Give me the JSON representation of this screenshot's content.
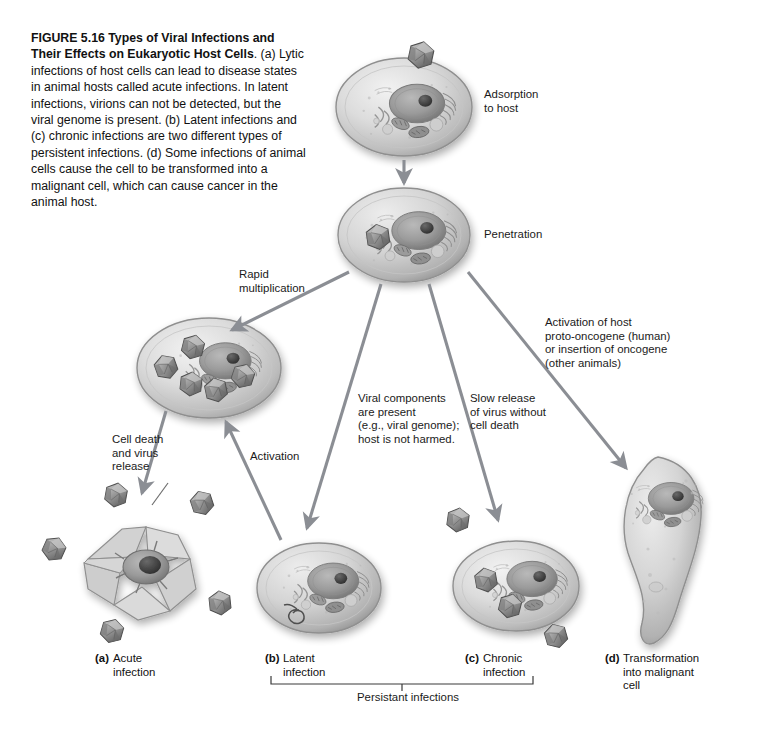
{
  "figure": {
    "number": "FIGURE 5.16",
    "title": "Types of Viral Infections and Their Effects on Eukaryotic Host Cells",
    "body": ". (a) Lytic infections of host cells can lead to disease states in animal hosts called acute infections. In latent infections, virions can not be detected, but the viral genome is present. (b) Latent infections and (c) chronic infections are two different types of persistent infections. (d) Some infections of animal cells cause the cell to be transformed into a malignant cell, which can cause cancer in the animal host."
  },
  "labels": {
    "adsorption": "Adsorption\nto host",
    "penetration": "Penetration",
    "rapid_multiplication": "Rapid\nmultiplication",
    "cell_death": "Cell death\nand virus\nrelease",
    "activation": "Activation",
    "viral_components": "Viral components\nare present\n(e.g., viral genome);\nhost is not harmed.",
    "slow_release": "Slow release\nof virus without\ncell death",
    "oncogene": "Activation of host\nproto-oncogene (human)\nor insertion of oncogene\n(other animals)",
    "persistent": "Persistant infections"
  },
  "panels": [
    {
      "tag": "(a)",
      "text": "Acute\ninfection"
    },
    {
      "tag": "(b)",
      "text": "Latent\ninfection"
    },
    {
      "tag": "(c)",
      "text": "Chronic\ninfection"
    },
    {
      "tag": "(d)",
      "text": "Transformation\ninto malignant\ncell"
    }
  ],
  "colors": {
    "arrow": "#8b8e94",
    "text": "#111111",
    "background": "#ffffff",
    "cell_membrane": "#9a9a9a",
    "cytoplasm": "#d9d9d9",
    "nucleus": "#8e8e8e",
    "virion": "#8d8d8d",
    "bracket": "#3a3a3a"
  }
}
